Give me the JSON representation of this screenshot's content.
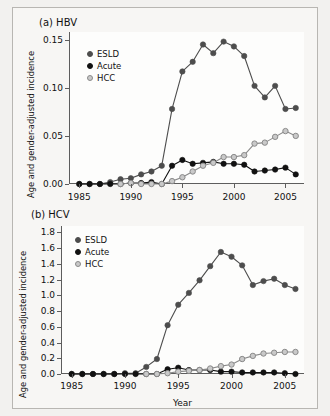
{
  "figure": {
    "xlabel": "Year",
    "ylabel": "Age and gender-adjusted incidence",
    "colors": {
      "eslD": "#4d4d4d",
      "acute": "#111111",
      "hcc": "#c9c9c9",
      "hcc_edge": "#8a8a8a",
      "axis": "#5d5d5d",
      "background": "#f7f6f4"
    }
  },
  "panel_a": {
    "title": "(a)  HBV",
    "legend": [
      {
        "label": "ESLD"
      },
      {
        "label": "Acute"
      },
      {
        "label": "HCC"
      }
    ],
    "ticklabels_y": [
      "0.00",
      "0.05",
      "0.10",
      "0.15"
    ],
    "ticklabels_x": [
      "1985",
      "1990",
      "1995",
      "2000",
      "2005"
    ]
  },
  "panel_b": {
    "title": "(b)  HCV",
    "legend": [
      {
        "label": "ESLD"
      },
      {
        "label": "Acute"
      },
      {
        "label": "HCC"
      }
    ],
    "ticklabels_y": [
      "0.0",
      "0.2",
      "0.4",
      "0.6",
      "0.8",
      "1.0",
      "1.2",
      "1.4",
      "1.6",
      "1.8"
    ],
    "ticklabels_x": [
      "1985",
      "1990",
      "1995",
      "2000",
      "2005"
    ]
  },
  "chart_data": [
    {
      "type": "line",
      "title": "(a)  HBV",
      "xlabel": "Year",
      "ylabel": "Age and gender-adjusted incidence",
      "x": [
        1985,
        1986,
        1987,
        1988,
        1989,
        1990,
        1991,
        1992,
        1993,
        1994,
        1995,
        1996,
        1997,
        1998,
        1999,
        2000,
        2001,
        2002,
        2003,
        2004,
        2005,
        2006
      ],
      "xlim": [
        1984,
        2006.8
      ],
      "ylim": [
        0,
        0.158
      ],
      "yticks": [
        0.0,
        0.05,
        0.1,
        0.15
      ],
      "xticks": [
        1985,
        1990,
        1995,
        2000,
        2005
      ],
      "grid": false,
      "legend_position": "upper-left",
      "series": [
        {
          "name": "ESLD",
          "color": "#4d4d4d",
          "values": [
            0.0,
            0.0,
            0.0,
            0.002,
            0.005,
            0.006,
            0.01,
            0.013,
            0.019,
            0.078,
            0.117,
            0.127,
            0.145,
            0.136,
            0.148,
            0.143,
            0.133,
            0.102,
            0.09,
            0.102,
            0.078,
            0.079
          ]
        },
        {
          "name": "Acute",
          "color": "#111111",
          "values": [
            0.0,
            0.0,
            0.0,
            0.0,
            0.0,
            0.001,
            0.001,
            0.002,
            0.0,
            0.019,
            0.025,
            0.021,
            0.022,
            0.023,
            0.021,
            0.021,
            0.02,
            0.013,
            0.014,
            0.015,
            0.017,
            0.01
          ]
        },
        {
          "name": "HCC",
          "color": "#c9c9c9",
          "values": [
            null,
            null,
            null,
            null,
            0.0,
            0.001,
            0.0,
            0.0,
            0.0,
            0.003,
            0.007,
            0.013,
            0.019,
            0.022,
            0.028,
            0.028,
            0.03,
            0.042,
            0.043,
            0.049,
            0.055,
            0.05
          ]
        }
      ]
    },
    {
      "type": "line",
      "title": "(b)  HCV",
      "xlabel": "Year",
      "ylabel": "Age and gender-adjusted incidence",
      "x": [
        1985,
        1986,
        1987,
        1988,
        1989,
        1990,
        1991,
        1992,
        1993,
        1994,
        1995,
        1996,
        1997,
        1998,
        1999,
        2000,
        2001,
        2002,
        2003,
        2004,
        2005,
        2006
      ],
      "xlim": [
        1984,
        2006.8
      ],
      "ylim": [
        0,
        1.88
      ],
      "yticks": [
        0.0,
        0.2,
        0.4,
        0.6,
        0.8,
        1.0,
        1.2,
        1.4,
        1.6,
        1.8
      ],
      "xticks": [
        1985,
        1990,
        1995,
        2000,
        2005
      ],
      "grid": false,
      "legend_position": "upper-left",
      "series": [
        {
          "name": "ESLD",
          "color": "#4d4d4d",
          "values": [
            0.0,
            0.0,
            0.0,
            0.0,
            0.0,
            0.01,
            0.01,
            0.09,
            0.19,
            0.62,
            0.88,
            1.03,
            1.19,
            1.37,
            1.55,
            1.49,
            1.38,
            1.13,
            1.18,
            1.21,
            1.13,
            1.08
          ]
        },
        {
          "name": "Acute",
          "color": "#111111",
          "values": [
            0.0,
            0.0,
            0.0,
            0.0,
            0.0,
            0.0,
            0.0,
            0.0,
            0.0,
            0.06,
            0.08,
            0.05,
            0.05,
            0.05,
            0.03,
            0.03,
            0.02,
            0.02,
            0.02,
            0.02,
            0.01,
            0.0
          ]
        },
        {
          "name": "HCC",
          "color": "#c9c9c9",
          "values": [
            null,
            null,
            null,
            null,
            null,
            null,
            null,
            0.0,
            0.0,
            0.01,
            0.03,
            0.04,
            0.05,
            0.07,
            0.1,
            0.12,
            0.19,
            0.23,
            0.26,
            0.27,
            0.28,
            0.28
          ]
        }
      ]
    }
  ]
}
